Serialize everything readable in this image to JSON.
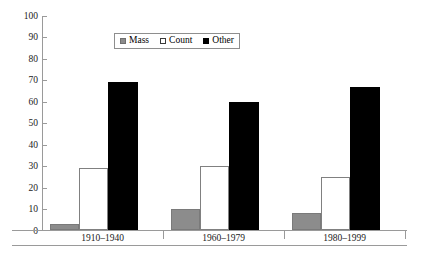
{
  "chart_data": {
    "type": "bar",
    "title": "",
    "subtitle": "",
    "xlabel": "",
    "ylabel": "",
    "categories": [
      "1910–1940",
      "1960–1979",
      "1980–1999"
    ],
    "series": [
      {
        "name": "Mass",
        "color": "#8c8c8c",
        "values": [
          3,
          10,
          8
        ]
      },
      {
        "name": "Count",
        "color": "#ffffff",
        "values": [
          29,
          30,
          25
        ]
      },
      {
        "name": "Other",
        "color": "#000000",
        "values": [
          69,
          60,
          67
        ]
      }
    ],
    "ylim": [
      0,
      100
    ],
    "ytick_step": 10,
    "ytick_labels": [
      "0",
      "10",
      "20",
      "30",
      "40",
      "50",
      "60",
      "70",
      "80",
      "90",
      "100"
    ],
    "grid": false,
    "legend_position": "top-center",
    "legend_entries": [
      "Mass",
      "Count",
      "Other"
    ]
  },
  "axis": {
    "line_color": "#9a9a9a",
    "text_color": "#1a1a1a"
  }
}
